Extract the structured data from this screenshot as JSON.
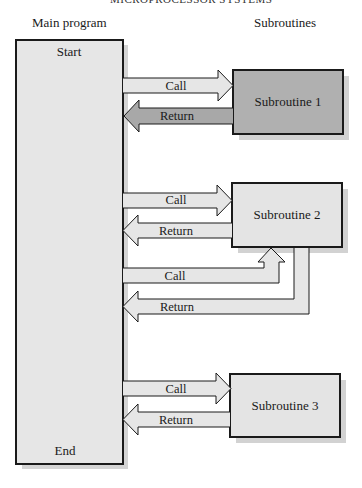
{
  "header": {
    "running_head": "MICROPROCESSOR SYSTEMS"
  },
  "labels": {
    "main_program": "Main program",
    "subroutines": "Subroutines"
  },
  "main_box": {
    "start": "Start",
    "end": "End"
  },
  "subroutines": [
    {
      "label": "Subroutine 1",
      "call": "Call",
      "return": "Return"
    },
    {
      "label": "Subroutine 2",
      "call": "Call",
      "return": "Return",
      "call2": "Call",
      "return2": "Return"
    },
    {
      "label": "Subroutine 3",
      "call": "Call",
      "return": "Return"
    }
  ],
  "colors": {
    "outline": "#1a1a1a",
    "light_fill": "#e4e4e4",
    "dark_fill": "#b0b0b0",
    "shadow": "#cfcfcf"
  }
}
